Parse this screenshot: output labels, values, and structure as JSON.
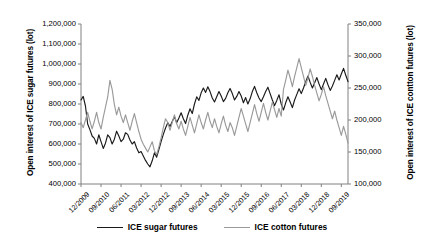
{
  "chart_data": {
    "type": "line",
    "title": "",
    "xlabel": "",
    "ylabel": "Open interest of ICE sugar futures (lot)",
    "y2label": "Open interest of ICE contton futures (lot)",
    "grid": false,
    "legend_position": "bottom",
    "ylim": [
      400000,
      1200000
    ],
    "y2lim": [
      100000,
      350000
    ],
    "yticks": [
      "400,000",
      "500,000",
      "600,000",
      "700,000",
      "800,000",
      "900,000",
      "1,000,000",
      "1,100,000",
      "1,200,000"
    ],
    "ytick_values": [
      400000,
      500000,
      600000,
      700000,
      800000,
      900000,
      1000000,
      1100000,
      1200000
    ],
    "y2ticks": [
      "100,000",
      "150,000",
      "200,000",
      "250,000",
      "300,000",
      "350,000"
    ],
    "y2tick_values": [
      100000,
      150000,
      200000,
      250000,
      300000,
      350000
    ],
    "xticks": [
      "12/2009",
      "09/2010",
      "06/2011",
      "03/2012",
      "12/2012",
      "09/2013",
      "06/2014",
      "03/2015",
      "12/2015",
      "09/2016",
      "06/2017",
      "03/2018",
      "12/2018",
      "09/2019"
    ],
    "xtick_indices": [
      0,
      9,
      18,
      27,
      36,
      45,
      54,
      63,
      72,
      81,
      90,
      99,
      108,
      117
    ],
    "n_points": 121,
    "series": [
      {
        "name": "ICE sugar futures",
        "axis": "left",
        "color": "#1a1a1a",
        "values": [
          820000,
          838000,
          790000,
          700000,
          672000,
          640000,
          628000,
          600000,
          646000,
          612000,
          578000,
          604000,
          646000,
          632000,
          600000,
          624000,
          664000,
          640000,
          612000,
          624000,
          656000,
          648000,
          620000,
          600000,
          612000,
          580000,
          556000,
          562000,
          540000,
          518000,
          500000,
          486000,
          516000,
          556000,
          534000,
          572000,
          612000,
          648000,
          680000,
          706000,
          688000,
          712000,
          736000,
          706000,
          730000,
          756000,
          726000,
          702000,
          744000,
          776000,
          752000,
          800000,
          836000,
          818000,
          856000,
          880000,
          858000,
          886000,
          862000,
          830000,
          810000,
          836000,
          862000,
          840000,
          812000,
          828000,
          856000,
          878000,
          852000,
          820000,
          838000,
          862000,
          840000,
          806000,
          832000,
          800000,
          826000,
          862000,
          888000,
          856000,
          830000,
          812000,
          836000,
          862000,
          884000,
          852000,
          820000,
          792000,
          818000,
          846000,
          800000,
          770000,
          806000,
          836000,
          810000,
          782000,
          820000,
          848000,
          876000,
          852000,
          880000,
          912000,
          940000,
          908000,
          880000,
          906000,
          932000,
          900000,
          872000,
          900000,
          928000,
          896000,
          868000,
          890000,
          918000,
          946000,
          920000,
          950000,
          978000,
          944000,
          912000
        ]
      },
      {
        "name": "ICE cotton futures",
        "axis": "right",
        "color": "#9a9a9a",
        "values": [
          196000,
          188000,
          200000,
          212000,
          198000,
          186000,
          198000,
          212000,
          196000,
          186000,
          204000,
          220000,
          236000,
          262000,
          248000,
          224000,
          208000,
          220000,
          206000,
          196000,
          208000,
          196000,
          184000,
          198000,
          210000,
          196000,
          182000,
          170000,
          162000,
          156000,
          150000,
          158000,
          166000,
          152000,
          146000,
          158000,
          172000,
          188000,
          202000,
          196000,
          184000,
          196000,
          208000,
          194000,
          186000,
          198000,
          186000,
          176000,
          190000,
          204000,
          192000,
          180000,
          194000,
          208000,
          196000,
          186000,
          200000,
          212000,
          198000,
          188000,
          202000,
          190000,
          180000,
          194000,
          206000,
          192000,
          182000,
          196000,
          188000,
          176000,
          190000,
          204000,
          218000,
          206000,
          194000,
          182000,
          196000,
          210000,
          224000,
          210000,
          198000,
          212000,
          226000,
          212000,
          200000,
          214000,
          228000,
          216000,
          204000,
          218000,
          206000,
          248000,
          262000,
          278000,
          266000,
          252000,
          268000,
          282000,
          296000,
          282000,
          268000,
          254000,
          266000,
          280000,
          268000,
          254000,
          242000,
          230000,
          240000,
          252000,
          238000,
          226000,
          214000,
          202000,
          214000,
          200000,
          188000,
          176000,
          190000,
          178000,
          164000
        ]
      }
    ]
  },
  "legend": {
    "entries": [
      {
        "label": "ICE sugar futures",
        "color": "#1a1a1a"
      },
      {
        "label": "ICE cotton futures",
        "color": "#9a9a9a"
      }
    ]
  }
}
